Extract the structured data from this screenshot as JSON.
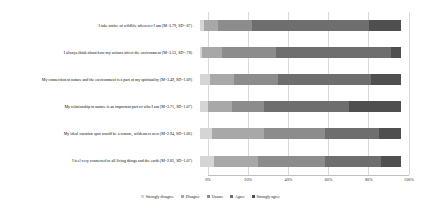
{
  "chart_data": {
    "type": "bar",
    "orientation": "horizontal",
    "stacked": true,
    "normalized": "100%",
    "title": "",
    "xlabel": "",
    "ylabel": "",
    "xlim": [
      0,
      100
    ],
    "grid": true,
    "legend_position": "bottom",
    "xticks": [
      "0%",
      "20%",
      "40%",
      "60%",
      "80%",
      "100%"
    ],
    "xtick_values": [
      0,
      20,
      40,
      60,
      80,
      100
    ],
    "categories": [
      "I take notice of wildlife wherever I am (M=3.79, SD=.87)",
      "I always think about how my actions affect the environment (M=3.53, SD=.78)",
      "My connection to nature and the environment is a part of my spirituality (M=3.49, SD=1.09)",
      "My relationship to nature is an important part of who I am (M=3.71, SD=1.07)",
      "My ideal vacation spot would be a remote, wilderness area (M=2.94, SD=1.06)",
      "I feel very connected to all living things and the earth (M=2.85, SD=1.07)"
    ],
    "series": [
      {
        "name": "Strongly disagree",
        "color": "#d5d5d5",
        "values": [
          2,
          1,
          5,
          4,
          6,
          7
        ]
      },
      {
        "name": "Disagree",
        "color": "#a8a8a8",
        "values": [
          7,
          10,
          12,
          12,
          26,
          22
        ]
      },
      {
        "name": "Unsure",
        "color": "#8c8c8c",
        "values": [
          17,
          27,
          22,
          16,
          30,
          33
        ]
      },
      {
        "name": "Agree",
        "color": "#6e6e6e",
        "values": [
          58,
          57,
          46,
          42,
          27,
          28
        ]
      },
      {
        "name": "Strongly agree",
        "color": "#4f4f4f",
        "values": [
          16,
          5,
          15,
          26,
          11,
          10
        ]
      }
    ]
  },
  "legend": {
    "items": [
      {
        "label": "Strongly disagree",
        "color": "#d5d5d5"
      },
      {
        "label": "Disagree",
        "color": "#a8a8a8"
      },
      {
        "label": "Unsure",
        "color": "#8c8c8c"
      },
      {
        "label": "Agree",
        "color": "#6e6e6e"
      },
      {
        "label": "Strongly agree",
        "color": "#4f4f4f"
      }
    ]
  }
}
